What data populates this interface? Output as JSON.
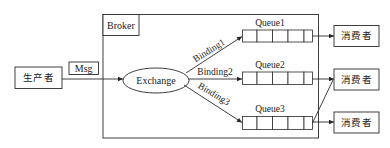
{
  "diagram": {
    "producer": {
      "label": "生产者"
    },
    "message": {
      "label": "Msg"
    },
    "broker": {
      "label": "Broker"
    },
    "exchange": {
      "label": "Exchange"
    },
    "bindings": [
      {
        "label": "Binding1",
        "to": "Queue1"
      },
      {
        "label": "Binding2",
        "to": "Queue2"
      },
      {
        "label": "Binding3",
        "to": "Queue3"
      }
    ],
    "queues": [
      {
        "label": "Queue1",
        "cells": 5
      },
      {
        "label": "Queue2",
        "cells": 5
      },
      {
        "label": "Queue3",
        "cells": 5
      }
    ],
    "consumers": [
      {
        "label": "消费者"
      },
      {
        "label": "消费者"
      },
      {
        "label": "消费者"
      }
    ],
    "edges": [
      {
        "from": "生产者",
        "to": "Exchange",
        "label": "Msg"
      },
      {
        "from": "Exchange",
        "to": "Queue1",
        "label": "Binding1"
      },
      {
        "from": "Exchange",
        "to": "Queue2",
        "label": "Binding2"
      },
      {
        "from": "Exchange",
        "to": "Queue3",
        "label": "Binding3"
      },
      {
        "from": "Queue1",
        "to": "消费者 (1)"
      },
      {
        "from": "Queue2",
        "to": "消费者 (2)"
      },
      {
        "from": "Queue3",
        "to": "消费者 (2)"
      },
      {
        "from": "Queue3",
        "to": "消费者 (3)"
      }
    ],
    "colors": {
      "line": "#2a2a2a",
      "text": "#222222",
      "background": "#ffffff"
    }
  }
}
